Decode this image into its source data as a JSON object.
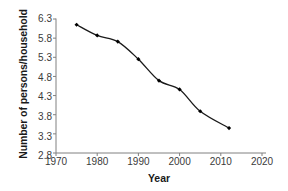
{
  "chart_data": {
    "type": "line",
    "title": "",
    "xlabel": "Year",
    "ylabel": "Number of persons/household",
    "x": [
      1975,
      1980,
      1985,
      1990,
      1995,
      2000,
      2005,
      2012
    ],
    "values": [
      6.15,
      5.87,
      5.71,
      5.25,
      4.69,
      4.46,
      3.89,
      3.45
    ],
    "series": [
      {
        "name": "Number of persons/household",
        "values": [
          6.15,
          5.87,
          5.71,
          5.25,
          4.69,
          4.46,
          3.89,
          3.45
        ]
      }
    ],
    "xlim": [
      1970,
      2020
    ],
    "ylim": [
      2.8,
      6.3
    ],
    "xticks": [
      1970,
      1980,
      1990,
      2000,
      2010,
      2020
    ],
    "xtick_labels": [
      "1970",
      "1980",
      "1990",
      "2000",
      "2010",
      "2020"
    ],
    "yticks": [
      2.8,
      3.3,
      3.8,
      4.3,
      4.8,
      5.3,
      5.8,
      6.3
    ],
    "ytick_labels": [
      "2.8",
      "3.3",
      "3.8",
      "4.3",
      "4.8",
      "5.3",
      "5.8",
      "6.3"
    ],
    "grid": false,
    "legend": false,
    "legend_position": "none",
    "marker": "diamond",
    "line_color": "#1a1a1a",
    "marker_color": "#000000",
    "axis_color": "#808080",
    "background_color": "#ffffff"
  }
}
